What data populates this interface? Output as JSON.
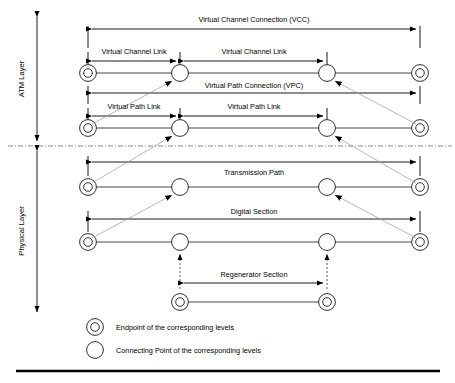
{
  "diagram": {
    "layers": [
      {
        "id": "atm",
        "label": "ATM Layer"
      },
      {
        "id": "physical",
        "label": "Physical Layer"
      }
    ],
    "spans": {
      "vcc": "Virtual Channel Connection (VCC)",
      "vcl_left": "Virtual Channel Link",
      "vcl_right": "Virtual Channel Link",
      "vpc": "Virtual Path Connection (VPC)",
      "vpl_left": "Virtual Path Link",
      "vpl_right": "Virtual Path Link",
      "transmission_path": "Transmission Path",
      "digital_section": "Digital Section",
      "regenerator_section": "Regenerator Section"
    },
    "legend": [
      {
        "symbol": "endpoint-circle",
        "text": "Endpoint of the corresponding levels"
      },
      {
        "symbol": "connecting-point-circle",
        "text": "Connecting Point  of the corresponding levels"
      }
    ],
    "colors": {
      "line": "#1a1a1a",
      "diagonal": "#9a9a9a",
      "divider": "#555555",
      "background": "#ffffff",
      "text": "#000000"
    }
  }
}
